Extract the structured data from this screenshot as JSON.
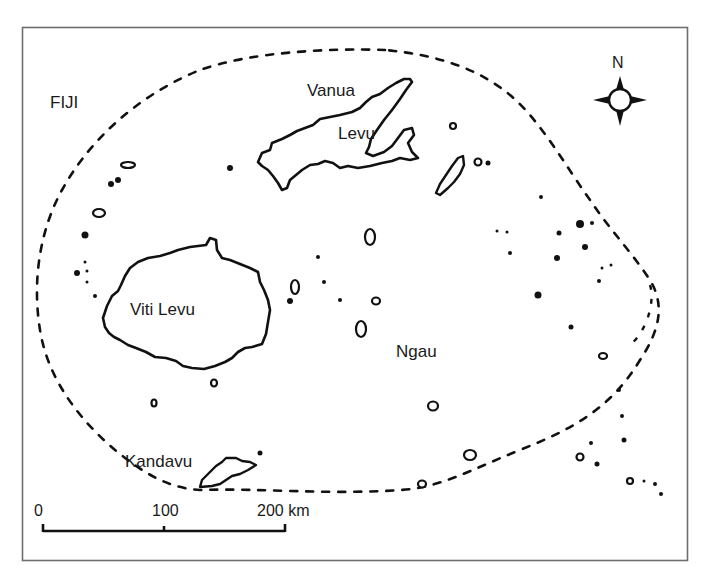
{
  "map": {
    "title": "FIJI",
    "labels": {
      "vanua": "Vanua",
      "levu_north": "Levu",
      "viti_levu": "Viti Levu",
      "ngau": "Ngau",
      "kandavu": "Kandavu"
    },
    "north_arrow": {
      "label": "N",
      "icon": "compass-rose-icon"
    },
    "scale_bar": {
      "ticks": [
        "0",
        "100",
        "200 km"
      ],
      "unit": "km",
      "max_value": 200
    },
    "boundary": {
      "style": "dashed",
      "description": "EEZ / archipelago boundary"
    },
    "colors": {
      "ink": "#111111",
      "frame": "#6e6e6e",
      "background": "#ffffff"
    }
  }
}
